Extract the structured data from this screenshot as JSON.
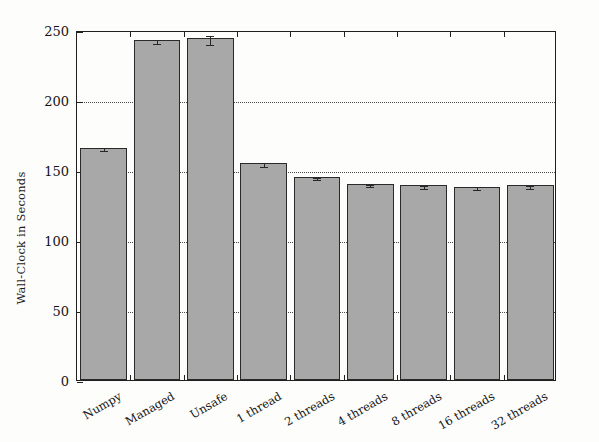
{
  "chart_data": {
    "type": "bar",
    "title": "",
    "subtitle": "",
    "xlabel": "",
    "ylabel": "Wall-Clock in Seconds",
    "categories": [
      "Numpy",
      "Managed",
      "Unsafe",
      "1 thread",
      "2 threads",
      "4 threads",
      "8 threads",
      "16 threads",
      "32 threads"
    ],
    "values": [
      166,
      243,
      244,
      155,
      145,
      140,
      139,
      138,
      139
    ],
    "errors": [
      1.0,
      1.5,
      3.5,
      1.5,
      1.0,
      1.0,
      1.0,
      1.0,
      1.0
    ],
    "ylim": [
      0,
      250
    ],
    "yticks": [
      0,
      50,
      100,
      150,
      200,
      250
    ],
    "ytick_labels": [
      "0",
      "50",
      "100",
      "150",
      "200",
      "250"
    ],
    "grid": "horizontal-dotted",
    "legend": "none",
    "bar_color": "#a8a8a8",
    "bar_edge_color": "#2a2a2a",
    "axis_color": "#1f1f1f",
    "grid_color": "#4a4a4a"
  }
}
